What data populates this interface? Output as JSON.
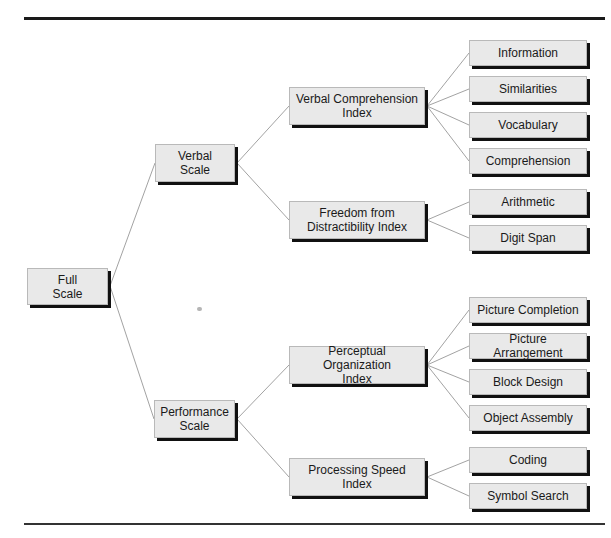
{
  "diagram": {
    "type": "hierarchy-tree",
    "root": {
      "label": "Full\nScale",
      "children": [
        {
          "label": "Verbal\nScale",
          "children": [
            {
              "label": "Verbal Comprehension\nIndex",
              "children": [
                "Information",
                "Similarities",
                "Vocabulary",
                "Comprehension"
              ]
            },
            {
              "label": "Freedom from\nDistractibility Index",
              "children": [
                "Arithmetic",
                "Digit Span"
              ]
            }
          ]
        },
        {
          "label": "Performance\nScale",
          "children": [
            {
              "label": "Perceptual Organization\nIndex",
              "children": [
                "Picture Completion",
                "Picture Arrangement",
                "Block Design",
                "Object Assembly"
              ]
            },
            {
              "label": "Processing Speed\nIndex",
              "children": [
                "Coding",
                "Symbol Search"
              ]
            }
          ]
        }
      ]
    }
  },
  "nodes": {
    "full_scale": "Full\nScale",
    "verbal_scale": "Verbal\nScale",
    "performance_scale": "Performance\nScale",
    "vci": "Verbal Comprehension\nIndex",
    "fdi": "Freedom from\nDistractibility Index",
    "poi": "Perceptual Organization\nIndex",
    "psi": "Processing Speed\nIndex",
    "information": "Information",
    "similarities": "Similarities",
    "vocabulary": "Vocabulary",
    "comprehension": "Comprehension",
    "arithmetic": "Arithmetic",
    "digit_span": "Digit Span",
    "picture_completion": "Picture Completion",
    "picture_arrangement": "Picture Arrangement",
    "block_design": "Block Design",
    "object_assembly": "Object Assembly",
    "coding": "Coding",
    "symbol_search": "Symbol Search"
  },
  "colors": {
    "box_fill": "#e9e9e9",
    "box_border": "#b9b9b9",
    "box_shadow": "#111111",
    "connector": "#8a8a8a",
    "rule": "#1a1a1a"
  }
}
